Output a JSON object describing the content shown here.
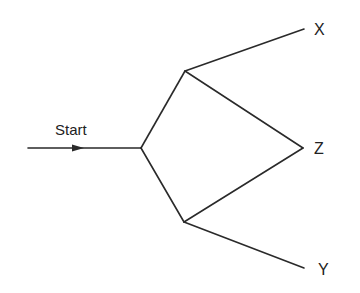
{
  "diagram": {
    "type": "graph",
    "start_label": "Start",
    "nodes": [
      {
        "id": "entry",
        "x": 28,
        "y": 148
      },
      {
        "id": "junction",
        "x": 141,
        "y": 148
      },
      {
        "id": "upper",
        "x": 185,
        "y": 71
      },
      {
        "id": "lower",
        "x": 184,
        "y": 222
      },
      {
        "id": "X",
        "label": "X",
        "x": 304,
        "y": 29
      },
      {
        "id": "Z",
        "label": "Z",
        "x": 303,
        "y": 148
      },
      {
        "id": "Y",
        "label": "Y",
        "x": 304,
        "y": 268
      }
    ],
    "edges": [
      {
        "from": "entry",
        "to": "junction",
        "arrow": true
      },
      {
        "from": "junction",
        "to": "upper"
      },
      {
        "from": "junction",
        "to": "lower"
      },
      {
        "from": "upper",
        "to": "X"
      },
      {
        "from": "upper",
        "to": "Z"
      },
      {
        "from": "lower",
        "to": "Z"
      },
      {
        "from": "lower",
        "to": "Y"
      }
    ],
    "labels": {
      "x": "X",
      "z": "Z",
      "y": "Y"
    },
    "colors": {
      "line": "#2a2a2a",
      "text": "#222222",
      "background": "#ffffff"
    }
  }
}
